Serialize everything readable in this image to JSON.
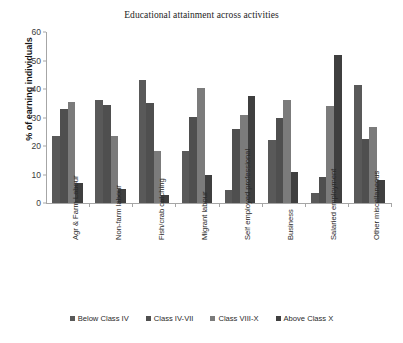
{
  "chart_data": {
    "type": "bar",
    "title": "Educational attainment across activities",
    "xlabel": "",
    "ylabel": "% of earning individuals",
    "ylim": [
      0,
      60
    ],
    "yticks": [
      0,
      10,
      20,
      30,
      40,
      50,
      60
    ],
    "grid": false,
    "legend_position": "bottom",
    "categories": [
      "Agr & Farm Labour",
      "Non-farm labour",
      "Fish/crab catching",
      "Migrant labour",
      "Self employed professional",
      "Business",
      "Salaried employment",
      "Other miscellaneous"
    ],
    "series": [
      {
        "name": "Below Class IV",
        "color": "#595959",
        "values": [
          23.5,
          36.3,
          43.0,
          18.4,
          4.6,
          22.0,
          3.6,
          41.3
        ]
      },
      {
        "name": "Class IV-VII",
        "color": "#4f4f4f",
        "values": [
          33.0,
          34.4,
          35.0,
          30.2,
          26.0,
          30.0,
          9.0,
          22.5
        ]
      },
      {
        "name": "Class VIII-X",
        "color": "#7b7b7b",
        "values": [
          35.5,
          23.4,
          18.2,
          40.4,
          31.0,
          36.0,
          34.0,
          26.6
        ]
      },
      {
        "name": "Above Class X",
        "color": "#3f3f3f",
        "values": [
          7.0,
          5.0,
          2.7,
          10.0,
          37.4,
          10.8,
          52.0,
          8.0
        ]
      }
    ]
  },
  "axis": {
    "color": "#a6a6a6"
  }
}
